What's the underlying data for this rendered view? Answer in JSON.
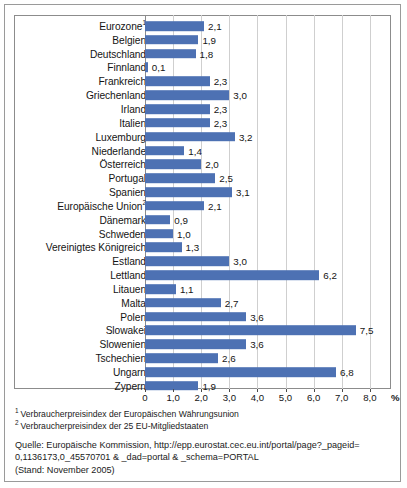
{
  "chart_data": {
    "type": "bar",
    "orientation": "horizontal",
    "title": "",
    "xlabel": "%",
    "ylabel": "",
    "xlim": [
      0,
      8.0
    ],
    "grid": true,
    "legend": "none",
    "bar_color": "#4d71b3",
    "categories": [
      "Eurozone¹",
      "Belgien",
      "Deutschland",
      "Finnland",
      "Frankreich",
      "Griechenland",
      "Irland",
      "Italien",
      "Luxemburg",
      "Niederlande",
      "Österreich",
      "Portugal",
      "Spanien",
      "Europäische Union²",
      "Dänemark",
      "Schweden",
      "Vereinigtes Königreich",
      "Estland",
      "Lettland",
      "Litauen",
      "Malta",
      "Polen",
      "Slowakei",
      "Slowenien",
      "Tschechien",
      "Ungarn",
      "Zypern"
    ],
    "values": [
      2.1,
      1.9,
      1.8,
      0.1,
      2.3,
      3.0,
      2.3,
      2.3,
      3.2,
      1.4,
      2.0,
      2.5,
      3.1,
      2.1,
      0.9,
      1.0,
      1.3,
      3.0,
      6.2,
      1.1,
      2.7,
      3.6,
      7.5,
      3.6,
      2.6,
      6.8,
      1.9
    ],
    "value_labels": [
      "2,1",
      "1,9",
      "1,8",
      "0,1",
      "2,3",
      "3,0",
      "2,3",
      "2,3",
      "3,2",
      "1,4",
      "2,0",
      "2,5",
      "3,1",
      "2,1",
      "0,9",
      "1,0",
      "1,3",
      "3,0",
      "6,2",
      "1,1",
      "2,7",
      "3,6",
      "7,5",
      "3,6",
      "2,6",
      "6,8",
      "1,9"
    ],
    "xticks": [
      0,
      1.0,
      2.0,
      3.0,
      4.0,
      5.0,
      6.0,
      7.0,
      8.0
    ],
    "xticklabels": [
      "0",
      "1,0",
      "2,0",
      "3,0",
      "4,0",
      "5,0",
      "6,0",
      "7,0",
      "8,0"
    ]
  },
  "footnotes": [
    {
      "marker": "1",
      "text": "Verbraucherpreisindex der Europäischen Währungsunion"
    },
    {
      "marker": "2",
      "text": "Verbraucherpreisindex der 25 EU-Mitgliedstaaten"
    }
  ],
  "source": {
    "line1": "Quelle: Europäische Kommission, http://epp.eurostat.cec.eu.int/portal/page?_pageid=",
    "line2": "0,1136173,0_45570701 & _dad=portal & _schema=PORTAL",
    "line3": "(Stand: November 2005)"
  }
}
